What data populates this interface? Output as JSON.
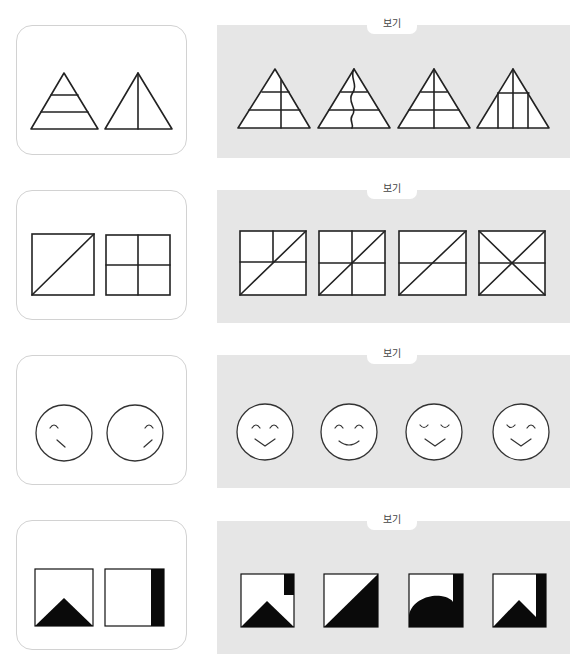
{
  "problems": [
    {
      "id": 1,
      "question": {
        "figures": [
          "triangle-with-two-horizontal-lines",
          "triangle-with-vertical-center-line"
        ]
      },
      "options_label": "보기",
      "options": [
        "triangle-two-horizontal-lines-vertical-offset-line",
        "triangle-two-horizontal-lines-wavy-vertical-line",
        "triangle-two-horizontal-lines-vertical-center-line",
        "triangle-one-horizontal-line-three-vertical-lines"
      ]
    },
    {
      "id": 2,
      "question": {
        "figures": [
          "square-with-diagonal",
          "square-divided-into-four"
        ]
      },
      "options_label": "보기",
      "options": [
        "square-horizontal-half-vertical-upper-diagonal",
        "square-four-quadrants-diagonal",
        "square-horizontal-line-diagonal",
        "square-horizontal-line-two-diagonals"
      ]
    },
    {
      "id": 3,
      "question": {
        "figures": [
          "face-left-eye-left-mouth",
          "face-right-eye-right-mouth"
        ]
      },
      "options_label": "보기",
      "options": [
        "face-open-eyes-v-mouth",
        "face-open-eyes-smile",
        "face-closed-eyes-v-mouth",
        "face-closed-left-open-right-v-mouth"
      ]
    },
    {
      "id": 4,
      "question": {
        "figures": [
          "square-black-bottom-triangle",
          "square-black-right-strip"
        ]
      },
      "options_label": "보기",
      "options": [
        "square-black-triangle-upper-right-strip",
        "square-black-diagonal-half",
        "square-black-semicircle-right-strip",
        "square-black-notch-right-strip"
      ]
    }
  ]
}
